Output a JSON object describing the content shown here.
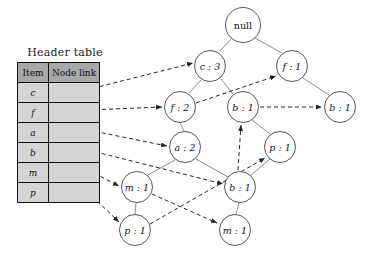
{
  "diagram": {
    "header_table": {
      "caption": "Header table",
      "columns": [
        "Item",
        "Node link"
      ],
      "rows": [
        {
          "item": "c",
          "node_link": ""
        },
        {
          "item": "f",
          "node_link": ""
        },
        {
          "item": "a",
          "node_link": ""
        },
        {
          "item": "b",
          "node_link": ""
        },
        {
          "item": "m",
          "node_link": ""
        },
        {
          "item": "p",
          "node_link": ""
        }
      ]
    },
    "nodes": [
      {
        "id": "null",
        "label": "null",
        "x": 243,
        "y": 25,
        "r": 18,
        "italic": false
      },
      {
        "id": "c3",
        "label": "c : 3",
        "x": 210,
        "y": 66,
        "r": 16,
        "italic": true
      },
      {
        "id": "f1",
        "label": "f : 1",
        "x": 292,
        "y": 66,
        "r": 16,
        "italic": true
      },
      {
        "id": "f2",
        "label": "f : 2",
        "x": 180,
        "y": 107,
        "r": 16,
        "italic": true
      },
      {
        "id": "b1m",
        "label": "b : 1",
        "x": 243,
        "y": 107,
        "r": 16,
        "italic": true
      },
      {
        "id": "b1r",
        "label": "b : 1",
        "x": 340,
        "y": 107,
        "r": 16,
        "italic": true
      },
      {
        "id": "a2",
        "label": "a : 2",
        "x": 185,
        "y": 147,
        "r": 16,
        "italic": true
      },
      {
        "id": "p1r",
        "label": "p : 1",
        "x": 280,
        "y": 147,
        "r": 16,
        "italic": true
      },
      {
        "id": "m1l",
        "label": "m : 1",
        "x": 137,
        "y": 187,
        "r": 16,
        "italic": true
      },
      {
        "id": "b1b",
        "label": "b : 1",
        "x": 240,
        "y": 187,
        "r": 16,
        "italic": true
      },
      {
        "id": "p1b",
        "label": "p : 1",
        "x": 135,
        "y": 230,
        "r": 16,
        "italic": true
      },
      {
        "id": "m1b",
        "label": "m : 1",
        "x": 235,
        "y": 230,
        "r": 16,
        "italic": true
      }
    ],
    "tree_edges": [
      {
        "from": "null",
        "to": "c3"
      },
      {
        "from": "null",
        "to": "f1"
      },
      {
        "from": "c3",
        "to": "f2"
      },
      {
        "from": "c3",
        "to": "b1m"
      },
      {
        "from": "f1",
        "to": "b1r"
      },
      {
        "from": "f2",
        "to": "a2"
      },
      {
        "from": "a2",
        "to": "m1l"
      },
      {
        "from": "a2",
        "to": "b1b"
      },
      {
        "from": "m1l",
        "to": "p1b"
      },
      {
        "from": "b1m",
        "to": "p1r"
      },
      {
        "from": "b1b",
        "to": "m1b"
      },
      {
        "from": "b1b",
        "to": "p1r"
      }
    ],
    "node_links": [
      {
        "from": "header-row-c",
        "to": "c3"
      },
      {
        "from": "header-row-f",
        "to": "f2"
      },
      {
        "from": "header-row-a",
        "to": "a2"
      },
      {
        "from": "header-row-b",
        "to": "b1b"
      },
      {
        "from": "header-row-m",
        "to": "m1l"
      },
      {
        "from": "header-row-p",
        "to": "p1b"
      },
      {
        "from": "f2",
        "to": "f1"
      },
      {
        "from": "b1m",
        "to": "b1r"
      },
      {
        "from": "b1b",
        "to": "b1m"
      },
      {
        "from": "m1l",
        "to": "m1b"
      },
      {
        "from": "p1b",
        "to": "p1r"
      }
    ],
    "colors": {
      "node_stroke": "#555555",
      "node_fill": "#ffffff",
      "edge": "#8a8a8a",
      "link": "#222222",
      "table_header_fill": "#a8a8a8",
      "table_body_fill": "#d5d5d5",
      "table_border": "#111111"
    }
  }
}
